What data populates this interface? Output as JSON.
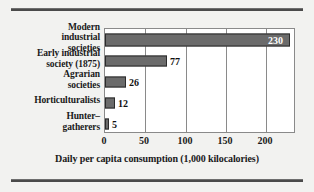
{
  "figure": {
    "background_color": "#f2f2f0",
    "rule_color": "#4a4a4a",
    "bar_fill": "#6b6b6b",
    "bar_stroke": "#2b2b2b",
    "plot_background": "#ffffff",
    "grid_color": "#8a8a8a"
  },
  "chart_data": {
    "type": "bar",
    "orientation": "horizontal",
    "title": "",
    "xlabel": "Daily per capita consumption (1,000 kilocalories)",
    "ylabel": "",
    "categories": [
      "Modern industrial societies",
      "Early industrial society (1875)",
      "Agrarian societies",
      "Horticulturalists",
      "Hunter–gatherers"
    ],
    "category_lines": [
      [
        "Modern",
        "industrial",
        "societies"
      ],
      [
        "Early industrial",
        "society (1875)"
      ],
      [
        "Agrarian",
        "societies"
      ],
      [
        "Horticulturalists"
      ],
      [
        "Hunter–",
        "gatherers"
      ]
    ],
    "values": [
      230,
      77,
      26,
      12,
      5
    ],
    "value_labels": [
      "230",
      "77",
      "26",
      "12",
      "5"
    ],
    "label_placement": [
      "inside",
      "outside",
      "outside",
      "outside",
      "outside"
    ],
    "xlim": [
      0,
      237
    ],
    "xticks": [
      0,
      50,
      100,
      150,
      200
    ],
    "xtick_labels": [
      "0",
      "50",
      "100",
      "150",
      "200"
    ],
    "grid": "vertical",
    "legend": "none"
  }
}
